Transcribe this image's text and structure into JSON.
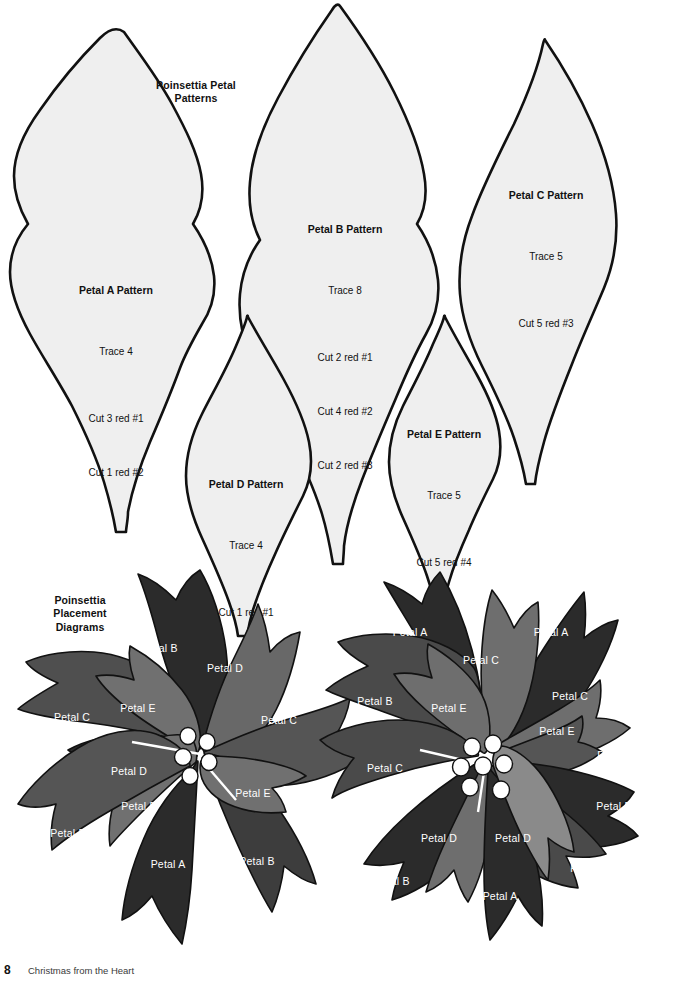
{
  "page": {
    "width": 683,
    "height": 981,
    "background": "#ffffff"
  },
  "sections": {
    "patterns_heading": "Poinsettia Petal\nPatterns",
    "placement_heading": "Poinsettia\nPlacement\nDiagrams"
  },
  "colors": {
    "pattern_fill": "#efefef",
    "outline": "#111111",
    "petal_dark": "#262626",
    "petal_mid_dark": "#4a4a4a",
    "petal_mid": "#626262",
    "petal_light": "#7c7c7c",
    "stamen": "#ffffff",
    "label_text": "#ffffff"
  },
  "patterns": [
    {
      "id": "petal-a",
      "title": "Petal A Pattern",
      "trace": "Trace 4",
      "cuts": [
        "Cut 3 red #1",
        "Cut 1 red #2"
      ]
    },
    {
      "id": "petal-b",
      "title": "Petal B Pattern",
      "trace": "Trace 8",
      "cuts": [
        "Cut 2 red #1",
        "Cut 4 red #2",
        "Cut 2 red #3"
      ]
    },
    {
      "id": "petal-c",
      "title": "Petal C Pattern",
      "trace": "Trace 5",
      "cuts": [
        "Cut 5 red #3"
      ]
    },
    {
      "id": "petal-d",
      "title": "Petal D Pattern",
      "trace": "Trace 4",
      "cuts": [
        "Cut 1 red #1",
        "Cut 1 red #3",
        "Cut 2 red #4"
      ]
    },
    {
      "id": "petal-e",
      "title": "Petal E Pattern",
      "trace": "Trace 5",
      "cuts": [
        "Cut 5 red #4"
      ]
    }
  ],
  "diagrams": {
    "left": {
      "name": "left-poinsettia-diagram",
      "stamen_count": 5,
      "labels": [
        {
          "text": "Petal B",
          "x": 160,
          "y": 648
        },
        {
          "text": "Petal D",
          "x": 225,
          "y": 668
        },
        {
          "text": "Petal E",
          "x": 138,
          "y": 708
        },
        {
          "text": "Petal C",
          "x": 72,
          "y": 717
        },
        {
          "text": "Petal C",
          "x": 279,
          "y": 720
        },
        {
          "text": "Petal D",
          "x": 129,
          "y": 771
        },
        {
          "text": "Petal E",
          "x": 253,
          "y": 793
        },
        {
          "text": "Petal E",
          "x": 139,
          "y": 806
        },
        {
          "text": "Petal B",
          "x": 68,
          "y": 833
        },
        {
          "text": "Petal A",
          "x": 168,
          "y": 864
        },
        {
          "text": "Petal B",
          "x": 257,
          "y": 861
        }
      ]
    },
    "right": {
      "name": "right-poinsettia-diagram",
      "stamen_count": 7,
      "labels": [
        {
          "text": "Petal A",
          "x": 410,
          "y": 632
        },
        {
          "text": "Petal A",
          "x": 551,
          "y": 632
        },
        {
          "text": "Petal C",
          "x": 481,
          "y": 660
        },
        {
          "text": "Petal B",
          "x": 375,
          "y": 701
        },
        {
          "text": "Petal E",
          "x": 449,
          "y": 708
        },
        {
          "text": "Petal C",
          "x": 570,
          "y": 696
        },
        {
          "text": "Petal E",
          "x": 557,
          "y": 731
        },
        {
          "text": "Petal C",
          "x": 385,
          "y": 768
        },
        {
          "text": "Petal B",
          "x": 615,
          "y": 755
        },
        {
          "text": "Petal B",
          "x": 614,
          "y": 806
        },
        {
          "text": "Petal D",
          "x": 439,
          "y": 838
        },
        {
          "text": "Petal D",
          "x": 513,
          "y": 838
        },
        {
          "text": "Petal B",
          "x": 392,
          "y": 881
        },
        {
          "text": "Petal B",
          "x": 588,
          "y": 868
        },
        {
          "text": "Petal A",
          "x": 500,
          "y": 896
        }
      ]
    }
  },
  "footer": {
    "page_number": "8",
    "book_title": "Christmas from the Heart"
  }
}
